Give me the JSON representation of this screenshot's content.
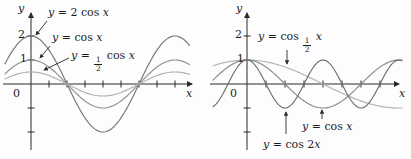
{
  "chart_data": [
    {
      "type": "line",
      "position": "left",
      "title": "",
      "xlabel": "x",
      "ylabel": "y",
      "origin_label": "0",
      "y_tick_labels": [
        "2",
        "1"
      ],
      "y_ticks": [
        2,
        1,
        -1,
        -2
      ],
      "x_tick_spacing": "pi/4 (unlabeled ticks)",
      "x_range_radians": [
        -1.13,
        6.94
      ],
      "y_range": [
        -2.4,
        2.7
      ],
      "grid": false,
      "legend_position": "inline-arrow-annotations",
      "series": [
        {
          "name": "y = 2 cos x",
          "expression": "2*cos(x)",
          "amplitude": 2,
          "angular_frequency": 1,
          "color": "#767676",
          "label_parts": [
            {
              "t": "y",
              "it": true
            },
            {
              "t": " = 2 cos ",
              "it": false
            },
            {
              "t": "x",
              "it": true
            }
          ]
        },
        {
          "name": "y = cos x",
          "expression": "cos(x)",
          "amplitude": 1,
          "angular_frequency": 1,
          "color": "#8f8f8f",
          "label_parts": [
            {
              "t": "y",
              "it": true
            },
            {
              "t": " = cos ",
              "it": false
            },
            {
              "t": "x",
              "it": true
            }
          ]
        },
        {
          "name": "y = 1/2 cos x",
          "expression": "0.5*cos(x)",
          "amplitude": 0.5,
          "angular_frequency": 1,
          "color": "#b0b0b0",
          "label_parts": [
            {
              "t": "y",
              "it": true
            },
            {
              "t": " = ",
              "it": false
            },
            {
              "frac": [
                "1",
                "2"
              ]
            },
            {
              "t": " cos ",
              "it": false
            },
            {
              "t": "x",
              "it": true
            }
          ]
        }
      ]
    },
    {
      "type": "line",
      "position": "right",
      "title": "",
      "xlabel": "x",
      "ylabel": "y",
      "origin_label": "0",
      "y_tick_labels": [
        "2",
        "1"
      ],
      "y_ticks": [
        2,
        1,
        -1,
        -2
      ],
      "x_tick_spacing": "pi/4 (unlabeled ticks)",
      "x_range_radians": [
        -1.41,
        6.45
      ],
      "y_range": [
        -2.4,
        2.7
      ],
      "grid": false,
      "legend_position": "inline-arrow-annotations",
      "series": [
        {
          "name": "y = cos 1/2 x",
          "expression": "cos(x/2)",
          "amplitude": 1,
          "angular_frequency": 0.5,
          "color": "#b3b3b3",
          "label_parts": [
            {
              "t": "y",
              "it": true
            },
            {
              "t": " = cos ",
              "it": false
            },
            {
              "frac": [
                "1",
                "2"
              ]
            },
            {
              "t": " ",
              "it": false
            },
            {
              "t": "x",
              "it": true
            }
          ]
        },
        {
          "name": "y = cos x",
          "expression": "cos(x)",
          "amplitude": 1,
          "angular_frequency": 1,
          "color": "#8a8a8a",
          "label_parts": [
            {
              "t": "y",
              "it": true
            },
            {
              "t": " = cos ",
              "it": false
            },
            {
              "t": "x",
              "it": true
            }
          ]
        },
        {
          "name": "y = cos 2x",
          "expression": "cos(2x)",
          "amplitude": 1,
          "angular_frequency": 2,
          "color": "#6e6e6e",
          "label_parts": [
            {
              "t": "y",
              "it": true
            },
            {
              "t": " = cos 2",
              "it": false
            },
            {
              "t": "x",
              "it": true
            }
          ]
        }
      ]
    }
  ]
}
